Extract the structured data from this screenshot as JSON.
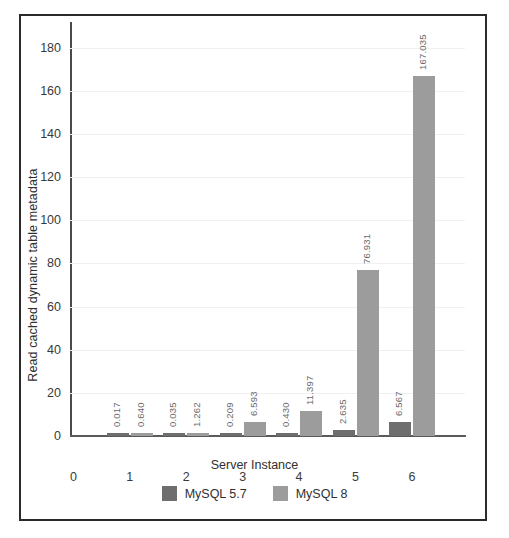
{
  "chart_data": {
    "type": "bar",
    "title": "",
    "xlabel": "Server Instance",
    "ylabel": "Read cached dynamic table metadata",
    "categories": [
      "1",
      "2",
      "3",
      "4",
      "5",
      "6"
    ],
    "xticks": [
      "0",
      "1",
      "2",
      "3",
      "4",
      "5",
      "6"
    ],
    "yticks": [
      0,
      20,
      40,
      60,
      80,
      100,
      120,
      140,
      160,
      180
    ],
    "ytick_labels": [
      "0",
      "20",
      "40",
      "60",
      "80",
      "100",
      "120",
      "140",
      "160",
      "180"
    ],
    "ylim": [
      0,
      190
    ],
    "grid": true,
    "legend_position": "bottom",
    "series": [
      {
        "name": "MySQL 5.7",
        "color": "#6e6e6e",
        "values": [
          0.017,
          0.035,
          0.209,
          0.43,
          2.635,
          6.567
        ],
        "labels": [
          "0.017",
          "0.035",
          "0.209",
          "0.430",
          "2.635",
          "6.567"
        ]
      },
      {
        "name": "MySQL 8",
        "color": "#9c9c9c",
        "values": [
          0.64,
          1.262,
          6.593,
          11.397,
          76.931,
          167.035
        ],
        "labels": [
          "0.640",
          "1.262",
          "6.593",
          "11.397",
          "76.931",
          "167.035"
        ]
      }
    ]
  },
  "legend": {
    "items": [
      {
        "label": "MySQL 5.7",
        "color": "#6e6e6e"
      },
      {
        "label": "MySQL 8",
        "color": "#9c9c9c"
      }
    ]
  }
}
